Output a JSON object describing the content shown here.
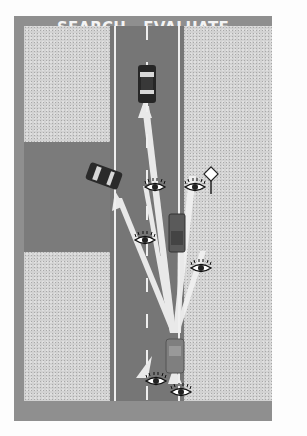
{
  "diagram": {
    "title": "SEARCH - EVALUATE",
    "colors": {
      "frame": "#8f8f8f",
      "title_text": "#f4f4f4",
      "road": "#767676",
      "shoulder": "#d2d2d2",
      "lot": "#7b7b7b",
      "car": "#2a2a2a",
      "sight_lines": "#f2f2f2"
    },
    "elements": {
      "cars": [
        {
          "label": "car-ahead",
          "position": "top of lane, heading north"
        },
        {
          "label": "car-from-lot",
          "position": "pulling out of parking lot on left"
        },
        {
          "label": "car-oncoming",
          "position": "middle of road"
        },
        {
          "label": "driver-car",
          "position": "bottom of road, heading north"
        }
      ],
      "eyes": 6,
      "sign": "diamond-warning-sign",
      "sight_lines_from": "driver-car"
    }
  }
}
